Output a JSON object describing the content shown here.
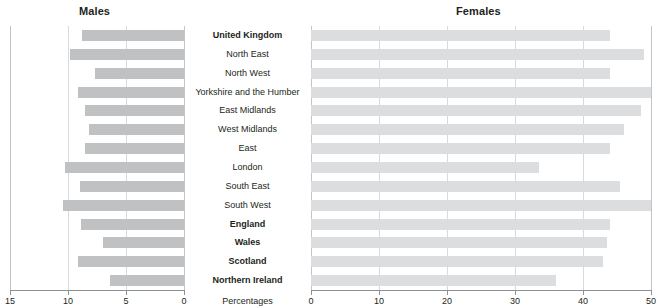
{
  "chart_data": {
    "type": "bar",
    "title": "",
    "orientation": "horizontal",
    "layout": "population-pyramid",
    "xlabel": "Percentages",
    "ylabel": "",
    "grid": true,
    "legend": "none",
    "panels": [
      {
        "name": "males",
        "title": "Males",
        "direction": "right-to-left",
        "xlim": [
          15,
          0
        ],
        "xticks": [
          15,
          10,
          5,
          0
        ],
        "xticklabels": [
          "15",
          "10",
          "5",
          "0"
        ],
        "bar_color": "#bfc1c3"
      },
      {
        "name": "females",
        "title": "Females",
        "direction": "left-to-right",
        "xlim": [
          0,
          50
        ],
        "xticks": [
          0,
          10,
          20,
          30,
          40,
          50
        ],
        "xticklabels": [
          "0",
          "10",
          "20",
          "30",
          "40",
          "50"
        ],
        "bar_color": "#dcdddf"
      }
    ],
    "categories": [
      "United Kingdom",
      "North East",
      "North West",
      "Yorkshire and the Humber",
      "East Midlands",
      "West Midlands",
      "East",
      "London",
      "South East",
      "South West",
      "England",
      "Wales",
      "Scotland",
      "Northern Ireland"
    ],
    "category_emphasis": [
      true,
      false,
      false,
      false,
      false,
      false,
      false,
      false,
      false,
      false,
      true,
      true,
      true,
      true
    ],
    "series": [
      {
        "name": "Males",
        "panel": "males",
        "values": [
          8.8,
          9.8,
          7.7,
          9.1,
          8.5,
          8.2,
          8.5,
          10.3,
          9.0,
          10.4,
          8.9,
          7.0,
          9.1,
          6.4
        ]
      },
      {
        "name": "Females",
        "panel": "females",
        "values": [
          44.0,
          49.0,
          44.0,
          50.0,
          48.5,
          46.0,
          44.0,
          33.5,
          45.5,
          50.0,
          44.0,
          43.5,
          43.0,
          36.0
        ]
      }
    ]
  },
  "axis": {
    "percentages_label": "Percentages"
  },
  "colors": {
    "male_bar": "#bfc1c3",
    "female_bar": "#dcdddf",
    "gridline": "#d7d9dc",
    "axis_line": "#8d9094",
    "text": "#231f20"
  }
}
